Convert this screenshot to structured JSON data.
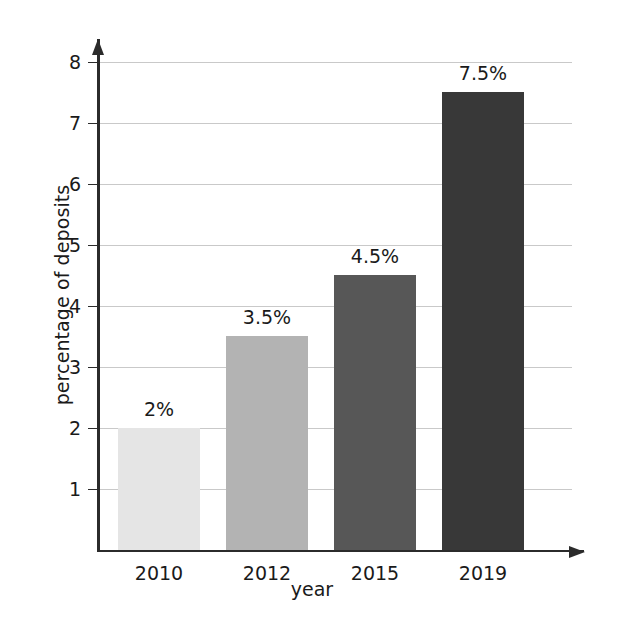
{
  "chart_data": {
    "type": "bar",
    "title": "",
    "subtitle": "",
    "xlabel": "year",
    "ylabel": "percentage of deposits",
    "categories": [
      "2010",
      "2012",
      "2015",
      "2019"
    ],
    "values": [
      2,
      3.5,
      4.5,
      7.5
    ],
    "data_labels": [
      "2%",
      "3.5%",
      "4.5%",
      "7.5%"
    ],
    "bar_colors": [
      "#e5e5e5",
      "#b3b3b3",
      "#575757",
      "#383838"
    ],
    "ylim": [
      0,
      8.6
    ],
    "ytick_values": [
      1,
      2,
      3,
      4,
      5,
      6,
      7,
      8
    ],
    "ytick_labels": [
      "1",
      "2",
      "3",
      "4",
      "5",
      "6",
      "7",
      "8"
    ],
    "grid": "horizontal",
    "gridline_color": "#c9c9c9",
    "axis_color": "#2b2b2b",
    "legend": "none",
    "series": [
      {
        "name": "percentage of deposits",
        "values": [
          2,
          3.5,
          4.5,
          7.5
        ]
      }
    ]
  }
}
